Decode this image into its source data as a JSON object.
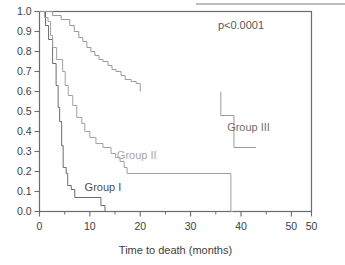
{
  "chart_data": {
    "type": "line",
    "subtype": "kaplan-meier-step",
    "title": "",
    "xlabel": "Time to death (months)",
    "ylabel": "",
    "xlim": [
      0,
      54
    ],
    "ylim": [
      0.0,
      1.0
    ],
    "grid": false,
    "legend_position": "inline-annotations",
    "xticks": [
      0,
      10,
      20,
      30,
      40,
      50,
      50
    ],
    "xtick_values": [
      0,
      10,
      20,
      30,
      40,
      50,
      54
    ],
    "xticklabels": [
      "0",
      "10",
      "20",
      "30",
      "40",
      "50",
      "50"
    ],
    "xminor_ticks": [
      5,
      15,
      25,
      35,
      45
    ],
    "yticks": [
      0.0,
      0.1,
      0.2,
      0.3,
      0.4,
      0.5,
      0.6,
      0.7,
      0.8,
      0.9,
      1.0
    ],
    "yticklabels": [
      "0.0",
      "0.1",
      "0.2",
      "0.3",
      "0.4",
      "0.5",
      "0.6",
      "0.7",
      "0.8",
      "0.9",
      "1.0"
    ],
    "annotations": [
      {
        "text": "p<0.0001",
        "x": 40.0,
        "y": 0.915,
        "color": "#595959"
      },
      {
        "text": "Group I",
        "x": 12.6,
        "y": 0.105,
        "color": "#4d4d4d"
      },
      {
        "text": "Group II",
        "x": 19.3,
        "y": 0.265,
        "color": "#a8a8a8"
      },
      {
        "text": "Group III",
        "x": 41.5,
        "y": 0.405,
        "color": "#6e6e6e"
      }
    ],
    "series": [
      {
        "name": "Group I",
        "label": "Group I",
        "color": "#6b6b6b",
        "points": [
          [
            0.0,
            1.0
          ],
          [
            1.2,
            1.0
          ],
          [
            1.2,
            0.93
          ],
          [
            1.8,
            0.93
          ],
          [
            1.8,
            0.86
          ],
          [
            2.6,
            0.86
          ],
          [
            2.6,
            0.74
          ],
          [
            3.3,
            0.74
          ],
          [
            3.3,
            0.63
          ],
          [
            3.7,
            0.63
          ],
          [
            3.7,
            0.52
          ],
          [
            4.0,
            0.52
          ],
          [
            4.0,
            0.45
          ],
          [
            4.4,
            0.45
          ],
          [
            4.4,
            0.33
          ],
          [
            4.7,
            0.33
          ],
          [
            4.7,
            0.22
          ],
          [
            5.3,
            0.22
          ],
          [
            5.3,
            0.19
          ],
          [
            5.6,
            0.19
          ],
          [
            5.6,
            0.13
          ],
          [
            6.3,
            0.13
          ],
          [
            6.3,
            0.11
          ],
          [
            7.0,
            0.11
          ],
          [
            7.0,
            0.07
          ],
          [
            12.2,
            0.07
          ],
          [
            12.2,
            0.03
          ],
          [
            13.0,
            0.03
          ],
          [
            13.0,
            0.0
          ],
          [
            13.4,
            0.0
          ]
        ]
      },
      {
        "name": "Group II",
        "label": "Group II",
        "color": "#a0a0a0",
        "points": [
          [
            0.0,
            1.0
          ],
          [
            1.0,
            1.0
          ],
          [
            1.0,
            0.97
          ],
          [
            1.7,
            0.97
          ],
          [
            1.7,
            0.95
          ],
          [
            2.2,
            0.95
          ],
          [
            2.2,
            0.88
          ],
          [
            2.6,
            0.88
          ],
          [
            2.6,
            0.82
          ],
          [
            3.4,
            0.82
          ],
          [
            3.4,
            0.76
          ],
          [
            4.6,
            0.76
          ],
          [
            4.6,
            0.7
          ],
          [
            5.1,
            0.7
          ],
          [
            5.1,
            0.63
          ],
          [
            5.7,
            0.63
          ],
          [
            5.7,
            0.58
          ],
          [
            6.6,
            0.58
          ],
          [
            6.6,
            0.53
          ],
          [
            7.4,
            0.53
          ],
          [
            7.4,
            0.47
          ],
          [
            8.4,
            0.47
          ],
          [
            8.4,
            0.44
          ],
          [
            9.0,
            0.44
          ],
          [
            9.0,
            0.4
          ],
          [
            10.0,
            0.4
          ],
          [
            10.0,
            0.37
          ],
          [
            11.2,
            0.37
          ],
          [
            11.2,
            0.34
          ],
          [
            12.6,
            0.34
          ],
          [
            12.6,
            0.32
          ],
          [
            14.2,
            0.32
          ],
          [
            14.2,
            0.29
          ],
          [
            15.1,
            0.29
          ],
          [
            15.1,
            0.27
          ],
          [
            16.0,
            0.27
          ],
          [
            16.0,
            0.25
          ],
          [
            16.8,
            0.25
          ],
          [
            16.8,
            0.22
          ],
          [
            17.4,
            0.22
          ],
          [
            17.4,
            0.19
          ],
          [
            38.0,
            0.19
          ],
          [
            38.0,
            0.0
          ],
          [
            38.4,
            0.0
          ]
        ]
      },
      {
        "name": "Group III",
        "label": "Group III",
        "color": "#9a9a9a",
        "points": [
          [
            0.0,
            1.0
          ],
          [
            2.6,
            1.0
          ],
          [
            2.6,
            0.98
          ],
          [
            4.3,
            0.98
          ],
          [
            4.3,
            0.96
          ],
          [
            6.0,
            0.96
          ],
          [
            6.0,
            0.93
          ],
          [
            6.9,
            0.93
          ],
          [
            6.9,
            0.9
          ],
          [
            7.8,
            0.9
          ],
          [
            7.8,
            0.87
          ],
          [
            8.6,
            0.87
          ],
          [
            8.6,
            0.85
          ],
          [
            9.4,
            0.85
          ],
          [
            9.4,
            0.82
          ],
          [
            10.2,
            0.82
          ],
          [
            10.2,
            0.8
          ],
          [
            11.0,
            0.8
          ],
          [
            11.0,
            0.78
          ],
          [
            11.8,
            0.78
          ],
          [
            11.8,
            0.76
          ],
          [
            12.6,
            0.76
          ],
          [
            12.6,
            0.75
          ],
          [
            13.6,
            0.75
          ],
          [
            13.6,
            0.73
          ],
          [
            14.4,
            0.73
          ],
          [
            14.4,
            0.71
          ],
          [
            15.2,
            0.71
          ],
          [
            15.2,
            0.7
          ],
          [
            16.2,
            0.7
          ],
          [
            16.2,
            0.68
          ],
          [
            17.0,
            0.68
          ],
          [
            17.0,
            0.66
          ],
          [
            18.2,
            0.66
          ],
          [
            18.2,
            0.65
          ],
          [
            19.2,
            0.65
          ],
          [
            19.2,
            0.64
          ],
          [
            20.0,
            0.64
          ],
          [
            20.0,
            0.6
          ]
        ]
      },
      {
        "name": "Group III tail",
        "label": "",
        "color": "#9a9a9a",
        "points": [
          [
            36.0,
            0.6
          ],
          [
            36.0,
            0.48
          ],
          [
            38.6,
            0.48
          ],
          [
            38.6,
            0.32
          ],
          [
            43.0,
            0.32
          ]
        ]
      }
    ]
  },
  "figure": {
    "axis_color": "#6b6b6b",
    "tick_label_color": "#3d3d3d",
    "xlabel_color": "#3d3d3d",
    "top_rule_color": "#bdbdbd"
  }
}
